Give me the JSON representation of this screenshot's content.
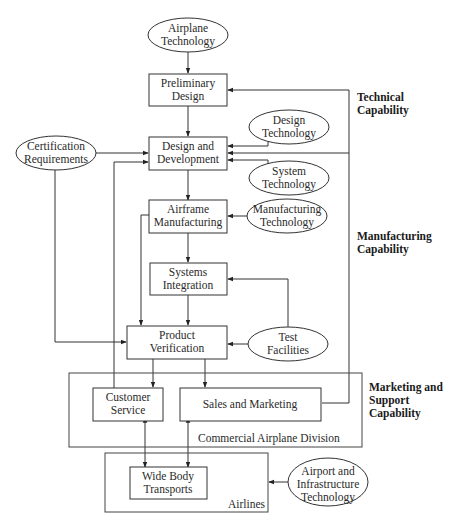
{
  "diagram": {
    "nodes": {
      "airplane_technology": {
        "line1": "Airplane",
        "line2": "Technology"
      },
      "preliminary_design": {
        "line1": "Preliminary",
        "line2": "Design"
      },
      "design_technology": {
        "line1": "Design",
        "line2": "Technology"
      },
      "certification_requirements": {
        "line1": "Certification",
        "line2": "Requirements"
      },
      "design_and_development": {
        "line1": "Design and",
        "line2": "Development"
      },
      "system_technology": {
        "line1": "System",
        "line2": "Technology"
      },
      "airframe_manufacturing": {
        "line1": "Airframe",
        "line2": "Manufacturing"
      },
      "manufacturing_technology": {
        "line1": "Manufacturing",
        "line2": "Technology"
      },
      "systems_integration": {
        "line1": "Systems",
        "line2": "Integration"
      },
      "product_verification": {
        "line1": "Product",
        "line2": "Verification"
      },
      "test_facilities": {
        "line1": "Test",
        "line2": "Facilities"
      },
      "customer_service": {
        "line1": "Customer",
        "line2": "Service"
      },
      "sales_and_marketing": {
        "line1": "Sales and Marketing"
      },
      "wide_body_transports": {
        "line1": "Wide Body",
        "line2": "Transports"
      },
      "airport_infrastructure_technology": {
        "line1": "Airport and",
        "line2": "Infrastructure",
        "line3": "Technology"
      }
    },
    "groups": {
      "commercial_airplane_division": "Commercial Airplane Division",
      "airlines": "Airlines"
    },
    "capabilities": {
      "technical": {
        "line1": "Technical",
        "line2": "Capability"
      },
      "manufacturing": {
        "line1": "Manufacturing",
        "line2": "Capability"
      },
      "marketing_support": {
        "line1": "Marketing and",
        "line2": "Support",
        "line3": "Capability"
      }
    }
  }
}
